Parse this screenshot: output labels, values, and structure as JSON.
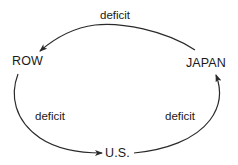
{
  "diagram": {
    "type": "cycle-flow",
    "nodes": {
      "row": {
        "label": "ROW"
      },
      "japan": {
        "label": "JAPAN"
      },
      "us": {
        "label": "U.S."
      }
    },
    "edges": [
      {
        "from": "JAPAN",
        "to": "ROW",
        "label": "deficit"
      },
      {
        "from": "ROW",
        "to": "U.S.",
        "label": "deficit"
      },
      {
        "from": "U.S.",
        "to": "JAPAN",
        "label": "deficit"
      }
    ],
    "colors": {
      "line": "#2a2a2a",
      "text": "#1a1a1a",
      "background": "#ffffff"
    }
  }
}
